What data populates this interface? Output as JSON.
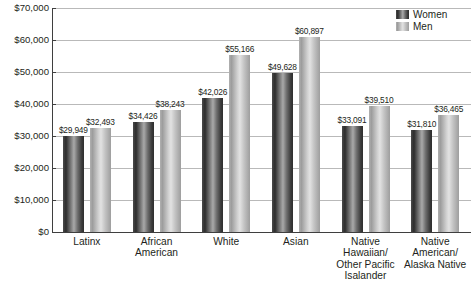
{
  "chart_data": {
    "type": "bar",
    "title": "Median Annual Earnings by Race and Ethnicity",
    "subtitle": "",
    "xlabel": "",
    "ylabel": "",
    "ylim": [
      0,
      70000
    ],
    "y_tick_step": 10000,
    "grid": true,
    "legend_position": "top-right",
    "categories": [
      "Latinx",
      "African American",
      "White",
      "Asian",
      "Native Hawaiian/ Other Pacific Isalander",
      "Native American/ Alaska Native"
    ],
    "category_lines": [
      [
        "Latinx"
      ],
      [
        "African",
        "American"
      ],
      [
        "White"
      ],
      [
        "Asian"
      ],
      [
        "Native",
        "Hawaiian/",
        "Other Pacific",
        "Isalander"
      ],
      [
        "Native",
        "American/",
        "Alaska Native"
      ]
    ],
    "series": [
      {
        "name": "Women",
        "color": "#2e2e2e",
        "values": [
          29949,
          34426,
          42026,
          49628,
          33091,
          31810
        ],
        "labels": [
          "$29,949",
          "$34,426",
          "$42,026",
          "$49,628",
          "$33,091",
          "$31,810"
        ]
      },
      {
        "name": "Men",
        "color": "#bfbfbf",
        "values": [
          32493,
          38243,
          55166,
          60897,
          39510,
          36465
        ],
        "labels": [
          "$32,493",
          "$38,243",
          "$55,166",
          "$60,897",
          "$39,510",
          "$36,465"
        ]
      }
    ],
    "y_tick_labels": [
      "$70,000",
      "$60,000",
      "$50,000",
      "$40,000",
      "$30,000",
      "$20,000",
      "$10,000",
      "$0"
    ],
    "y_tick_values": [
      70000,
      60000,
      50000,
      40000,
      30000,
      20000,
      10000,
      0
    ]
  },
  "legend": {
    "items": [
      {
        "label": "Women"
      },
      {
        "label": "Men"
      }
    ]
  }
}
